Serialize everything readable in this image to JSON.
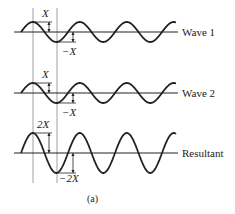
{
  "waves": [
    {
      "name": "wave-1",
      "label": "Wave 1",
      "amplitude_label": "X",
      "neg_amplitude_label": "−X",
      "amplitude": 1
    },
    {
      "name": "wave-2",
      "label": "Wave 2",
      "amplitude_label": "X",
      "neg_amplitude_label": "−X",
      "amplitude": 1
    },
    {
      "name": "resultant",
      "label": "Resultant",
      "amplitude_label": "2X",
      "neg_amplitude_label": "−2X",
      "amplitude": 2
    }
  ],
  "cycles": 3.3,
  "caption": "(a)",
  "colors": {
    "ink": "#222222",
    "guide": "#888888"
  }
}
